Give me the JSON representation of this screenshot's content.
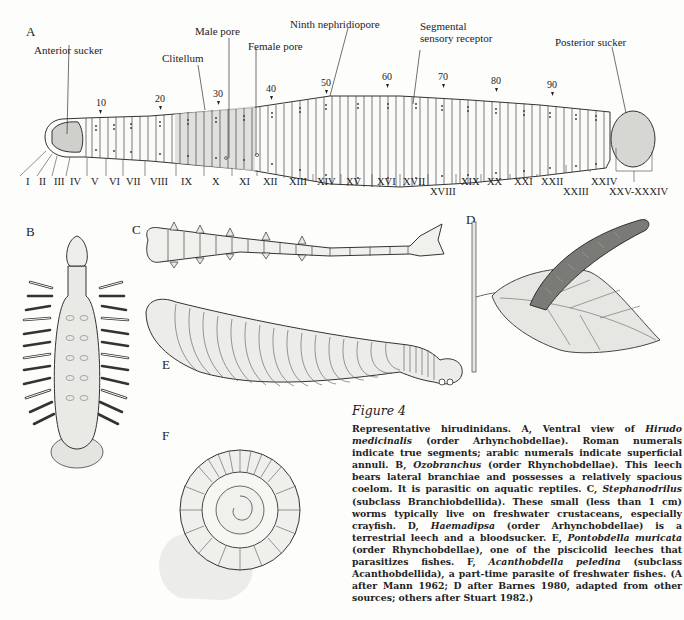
{
  "figure": {
    "title": "Figure 4",
    "panels": {
      "A": "A",
      "B": "B",
      "C": "C",
      "D": "D",
      "E": "E",
      "F": "F"
    },
    "panel_a": {
      "callouts": {
        "anterior_sucker": "Anterior sucker",
        "clitellum": "Clitellum",
        "male_pore": "Male pore",
        "female_pore": "Female pore",
        "ninth_nephridiopore": "Ninth nephridiopore",
        "segmental_sensory_receptor_1": "Segmental",
        "segmental_sensory_receptor_2": "sensory receptor",
        "posterior_sucker": "Posterior sucker"
      },
      "annuli_numbers": [
        "10",
        "20",
        "30",
        "40",
        "50",
        "60",
        "70",
        "80",
        "90"
      ],
      "segments": [
        "I",
        "II",
        "III",
        "IV",
        "V",
        "VI",
        "VII",
        "VIII",
        "IX",
        "X",
        "XI",
        "XII",
        "XIII",
        "XIV",
        "XV",
        "XVI",
        "XVII",
        "XVIII",
        "XIX",
        "XX",
        "XXI",
        "XXII",
        "XXIII",
        "XXIV",
        "XXV-XXXIV"
      ]
    },
    "caption": {
      "p1": "Representative hirudinidans. A, Ventral view of ",
      "t1": "Hirudo medicinalis",
      "p2": " (order Arhynchobdellae). Roman numerals indicate true segments; arabic numerals indicate superficial annuli. B, ",
      "t2": "Ozobranchus",
      "p3": " (order Rhynchobdellae). This leech bears lateral branchiae and possesses a relatively spacious coelom. It is parasitic on aquatic reptiles. C, ",
      "t3": "Stephanodrilus",
      "p4": " (subclass Branchiobdellida). These small (less than 1 cm) worms typically live on freshwater crustaceans, especially crayfish. D, ",
      "t4": "Haemadipsa",
      "p5": " (order Arhynchobdellae) is a terrestrial leech and a bloodsucker. E, ",
      "t5": "Pontobdella muricata",
      "p6": " (order Rhynchobdellae), one of the piscicolid leeches that parasitizes fishes. F, ",
      "t6": "Acanthobdella peledina",
      "p7": " (subclass Acanthobdellida), a part-time parasite of freshwater fishes. (A after Mann 1962; D after Barnes 1980, adapted from other sources; others after Stuart 1982.)"
    }
  }
}
